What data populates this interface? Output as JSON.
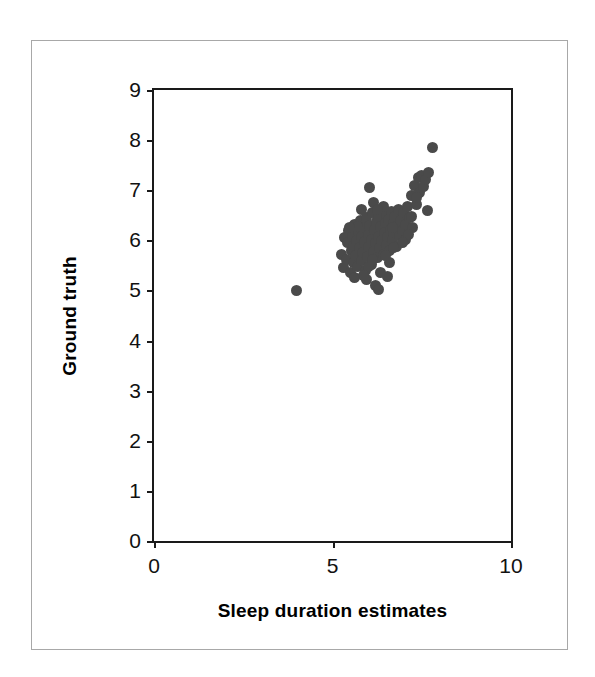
{
  "figure": {
    "background_color": "#ffffff",
    "frame_color": "#a8a8a8",
    "axis_color": "#1a1a1a"
  },
  "chart_data": {
    "type": "scatter",
    "title": "",
    "xlabel": "Sleep duration estimates",
    "ylabel": "Ground truth",
    "xlim": [
      0,
      10
    ],
    "ylim": [
      0,
      9
    ],
    "xticks": [
      0,
      5,
      10
    ],
    "xtick_labels": [
      "0",
      "5",
      "10"
    ],
    "yticks": [
      0,
      1,
      2,
      3,
      4,
      5,
      6,
      7,
      8,
      9
    ],
    "ytick_labels": [
      "0",
      "1",
      "2",
      "3",
      "4",
      "5",
      "6",
      "7",
      "8",
      "9"
    ],
    "grid": false,
    "legend": null,
    "marker": {
      "shape": "circle",
      "color": "#4a4a4a",
      "size_px": 11
    },
    "series": [
      {
        "name": "Sleep duration vs ground truth",
        "points": [
          [
            4.0,
            5.0
          ],
          [
            5.25,
            5.72
          ],
          [
            5.3,
            5.45
          ],
          [
            5.35,
            6.05
          ],
          [
            5.4,
            5.62
          ],
          [
            5.42,
            5.95
          ],
          [
            5.45,
            6.2
          ],
          [
            5.5,
            5.35
          ],
          [
            5.52,
            5.8
          ],
          [
            5.55,
            6.1
          ],
          [
            5.58,
            5.55
          ],
          [
            5.6,
            5.9
          ],
          [
            5.62,
            6.32
          ],
          [
            5.65,
            5.7
          ],
          [
            5.68,
            6.0
          ],
          [
            5.7,
            5.48
          ],
          [
            5.72,
            6.18
          ],
          [
            5.75,
            5.85
          ],
          [
            5.78,
            6.4
          ],
          [
            5.8,
            5.6
          ],
          [
            5.82,
            6.08
          ],
          [
            5.85,
            5.75
          ],
          [
            5.88,
            6.25
          ],
          [
            5.9,
            5.98
          ],
          [
            5.92,
            5.4
          ],
          [
            5.95,
            6.45
          ],
          [
            5.98,
            5.68
          ],
          [
            6.0,
            6.12
          ],
          [
            6.02,
            5.88
          ],
          [
            6.05,
            6.3
          ],
          [
            6.08,
            5.52
          ],
          [
            6.1,
            6.02
          ],
          [
            6.12,
            6.55
          ],
          [
            6.15,
            5.78
          ],
          [
            6.18,
            6.22
          ],
          [
            6.2,
            5.95
          ],
          [
            6.22,
            6.38
          ],
          [
            6.25,
            5.65
          ],
          [
            6.28,
            6.08
          ],
          [
            6.3,
            6.48
          ],
          [
            6.32,
            5.85
          ],
          [
            6.35,
            6.28
          ],
          [
            6.38,
            6.0
          ],
          [
            6.4,
            6.6
          ],
          [
            6.42,
            5.72
          ],
          [
            6.45,
            6.15
          ],
          [
            6.48,
            6.35
          ],
          [
            6.5,
            5.92
          ],
          [
            6.52,
            6.52
          ],
          [
            6.55,
            6.08
          ],
          [
            6.58,
            6.42
          ],
          [
            6.6,
            5.8
          ],
          [
            6.62,
            6.22
          ],
          [
            6.65,
            6.58
          ],
          [
            6.68,
            6.02
          ],
          [
            6.7,
            6.35
          ],
          [
            6.72,
            6.15
          ],
          [
            6.75,
            6.48
          ],
          [
            6.78,
            5.88
          ],
          [
            6.8,
            6.28
          ],
          [
            6.85,
            6.62
          ],
          [
            6.88,
            6.1
          ],
          [
            6.9,
            6.4
          ],
          [
            6.95,
            6.2
          ],
          [
            7.0,
            6.55
          ],
          [
            7.05,
            6.32
          ],
          [
            7.1,
            6.68
          ],
          [
            7.15,
            6.45
          ],
          [
            7.2,
            6.9
          ],
          [
            7.25,
            6.25
          ],
          [
            7.3,
            7.1
          ],
          [
            7.35,
            6.72
          ],
          [
            7.4,
            7.25
          ],
          [
            7.45,
            6.95
          ],
          [
            7.5,
            7.3
          ],
          [
            7.55,
            7.08
          ],
          [
            7.6,
            7.22
          ],
          [
            7.65,
            6.6
          ],
          [
            7.7,
            7.35
          ],
          [
            7.8,
            7.85
          ],
          [
            6.05,
            7.05
          ],
          [
            5.8,
            6.62
          ],
          [
            6.55,
            5.28
          ],
          [
            6.2,
            5.1
          ],
          [
            6.3,
            5.02
          ],
          [
            5.95,
            5.22
          ],
          [
            6.02,
            5.48
          ],
          [
            6.6,
            5.55
          ],
          [
            6.48,
            5.7
          ],
          [
            5.88,
            5.3
          ],
          [
            7.05,
            6.02
          ],
          [
            7.12,
            6.12
          ],
          [
            6.95,
            5.95
          ],
          [
            6.42,
            6.68
          ],
          [
            6.15,
            6.75
          ],
          [
            5.7,
            6.28
          ],
          [
            5.62,
            5.25
          ],
          [
            6.35,
            5.35
          ],
          [
            6.72,
            5.85
          ],
          [
            7.22,
            6.48
          ],
          [
            5.48,
            6.25
          ],
          [
            6.25,
            6.62
          ],
          [
            6.12,
            5.62
          ],
          [
            6.68,
            6.25
          ],
          [
            7.35,
            6.85
          ]
        ]
      }
    ]
  }
}
